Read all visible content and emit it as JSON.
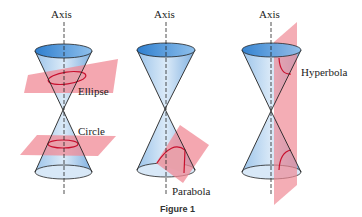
{
  "figure": {
    "caption": "Figure 1",
    "panels": [
      {
        "axis_label": "Axis",
        "section_labels": [
          "Ellipse",
          "Circle"
        ]
      },
      {
        "axis_label": "Axis",
        "section_labels": [
          "Parabola"
        ]
      },
      {
        "axis_label": "Axis",
        "section_labels": [
          "Hyperbola"
        ]
      }
    ]
  },
  "colors": {
    "cone_blue": "#5b9bd8",
    "cone_light": "#cfe3f5",
    "plane_red": "#f08a96",
    "curve_red": "#c8102e"
  }
}
